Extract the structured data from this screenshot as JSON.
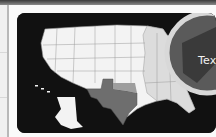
{
  "window": {
    "topbar_color": "#5a5a5a"
  },
  "map_card": {
    "subject": "United States map",
    "highlighted_state": "Texas",
    "magnifier_label": "Texas",
    "colors": {
      "background": "#111111",
      "states": "#f5f5f5",
      "state_borders": "#9a9a9a",
      "highlight": "#6e6e6e",
      "secondary_highlight": "#9e9e9e",
      "east_states": "#dcdcdc"
    }
  }
}
